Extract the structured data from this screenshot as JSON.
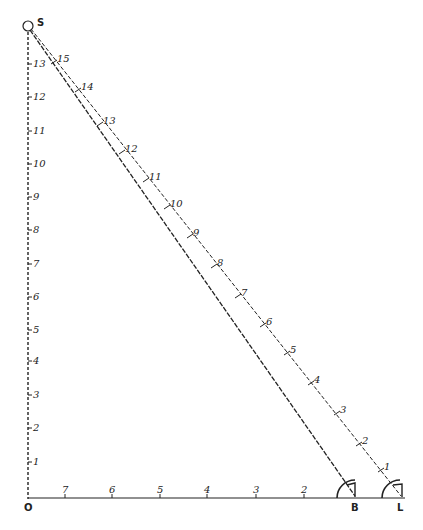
{
  "points": {
    "source": {
      "label": "S",
      "x": 28,
      "y": 26
    },
    "origin": {
      "label": "O",
      "x": 28,
      "y": 500
    },
    "b": {
      "label": "B",
      "x": 355,
      "y": 498
    },
    "l": {
      "label": "L",
      "x": 400,
      "y": 498
    }
  },
  "vertical_scale": {
    "labels": [
      "1",
      "2",
      "3",
      "4",
      "5",
      "6",
      "7",
      "8",
      "9",
      "10",
      "11",
      "12",
      "13"
    ],
    "y": [
      462,
      428,
      395,
      361,
      330,
      297,
      264,
      230,
      197,
      164,
      131,
      97,
      64
    ]
  },
  "horizontal_scale": {
    "labels": [
      "7",
      "6",
      "5",
      "4",
      "3",
      "2"
    ],
    "x": [
      65,
      112,
      160,
      207,
      256,
      304
    ]
  },
  "hypotenuse_scale": {
    "labels": [
      "1",
      "2",
      "3",
      "4",
      "5",
      "6",
      "7",
      "8",
      "9",
      "10",
      "11",
      "12",
      "13",
      "14",
      "15"
    ],
    "pos": [
      [
        381,
        470
      ],
      [
        359,
        444
      ],
      [
        337,
        413
      ],
      [
        311,
        383
      ],
      [
        287,
        353
      ],
      [
        263,
        325
      ],
      [
        238,
        296
      ],
      [
        214,
        266
      ],
      [
        190,
        236
      ],
      [
        167,
        207
      ],
      [
        146,
        180
      ],
      [
        122,
        152
      ],
      [
        100,
        124
      ],
      [
        78,
        90
      ],
      [
        54,
        62
      ]
    ]
  },
  "colors": {
    "ink": "#222222"
  }
}
